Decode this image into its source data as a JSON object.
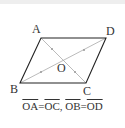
{
  "diagram": {
    "type": "parallelogram",
    "vertices": {
      "A": {
        "label": "A",
        "x": 41,
        "y": 38
      },
      "B": {
        "label": "B",
        "x": 20,
        "y": 83
      },
      "C": {
        "label": "C",
        "x": 86,
        "y": 83
      },
      "D": {
        "label": "D",
        "x": 106,
        "y": 38
      }
    },
    "center": {
      "label": "O",
      "x": 63,
      "y": 61
    },
    "colors": {
      "edge": "#222222",
      "diagonal": "#aaaaaa",
      "tick": "#999999",
      "text": "#333333"
    }
  },
  "caption": {
    "seg1": "OA",
    "eq1": "=",
    "seg2": "OC",
    "comma": ", ",
    "seg3": "OB",
    "eq2": "=",
    "seg4": "OD"
  }
}
